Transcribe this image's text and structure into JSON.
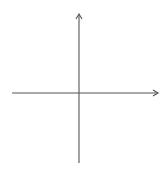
{
  "chart_data": {
    "type": "scatter",
    "title": "",
    "xlabel": "x",
    "ylabel": "y",
    "xlim": [
      -6,
      6
    ],
    "ylim": [
      -6,
      6
    ],
    "grid": true,
    "x_ticks": [
      "-5",
      "-4",
      "-3",
      "-2",
      "-1",
      "1",
      "2",
      "3",
      "4",
      "5"
    ],
    "y_ticks": [
      "5",
      "4",
      "3",
      "2",
      "1",
      "-1",
      "-2",
      "-3",
      "-4",
      "-5"
    ],
    "series": []
  },
  "colors": {
    "grid": "#c8c8c8",
    "axis": "#555555",
    "text": "#555555"
  }
}
